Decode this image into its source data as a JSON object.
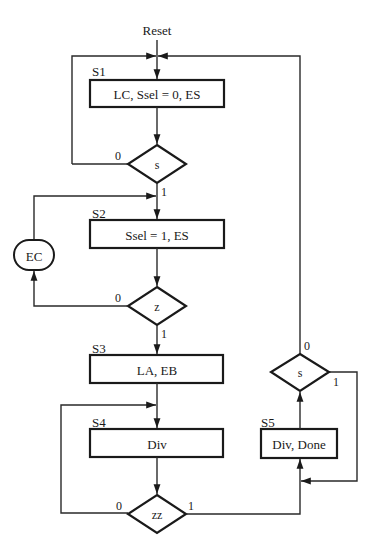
{
  "diagram": {
    "reset_label": "Reset",
    "states": [
      {
        "name": "S1",
        "actions": "LC, Ssel = 0, ES"
      },
      {
        "name": "S2",
        "actions": "Ssel = 1, ES"
      },
      {
        "name": "S3",
        "actions": "LA, EB"
      },
      {
        "name": "S4",
        "actions": "Div"
      },
      {
        "name": "S5",
        "actions": "Div, Done"
      }
    ],
    "decisions": [
      {
        "condition": "s",
        "false_label": "0",
        "true_label": "1",
        "after_state": "S1"
      },
      {
        "condition": "z",
        "false_label": "0",
        "true_label": "1",
        "after_state": "S2"
      },
      {
        "condition": "zz",
        "false_label": "0",
        "true_label": "1",
        "after_state": "S4"
      },
      {
        "condition": "s",
        "false_label": "0",
        "true_label": "1",
        "after_state": "S5"
      }
    ],
    "conditional_outputs": [
      {
        "label": "EC"
      }
    ],
    "colors": {
      "line": "#1a1a1a",
      "background": "#ffffff"
    }
  }
}
